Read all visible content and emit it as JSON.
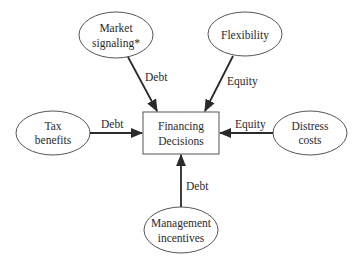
{
  "diagram": {
    "center": {
      "line1": "Financing",
      "line2": "Decisions"
    },
    "nodes": {
      "market_signaling": {
        "line1": "Market",
        "line2": "signaling*"
      },
      "flexibility": {
        "line1": "Flexibility"
      },
      "tax_benefits": {
        "line1": "Tax",
        "line2": "benefits"
      },
      "distress_costs": {
        "line1": "Distress",
        "line2": "costs"
      },
      "management_incentives": {
        "line1": "Management",
        "line2": "incentives"
      }
    },
    "edges": {
      "market_signaling": "Debt",
      "flexibility": "Equity",
      "tax_benefits": "Debt",
      "distress_costs": "Equity",
      "management_incentives": "Debt"
    },
    "colors": {
      "stroke": "#555555",
      "arrow": "#2a2a2a",
      "text": "#2a2a2a",
      "background": "#ffffff"
    }
  }
}
